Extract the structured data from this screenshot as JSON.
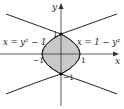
{
  "diagram": {
    "axes": {
      "x_label": "x",
      "y_label": "y"
    },
    "curves": [
      {
        "name": "left-parabola",
        "equation": "x = y² − 1"
      },
      {
        "name": "right-parabola",
        "equation": "x = 1 − y²"
      }
    ],
    "tick_labels": {
      "y_pos": "1",
      "y_neg": "−1",
      "x_neg": "−1",
      "x_pos": "1"
    },
    "colors": {
      "region_fill": "#c8c8c8",
      "stroke": "#222222"
    }
  }
}
